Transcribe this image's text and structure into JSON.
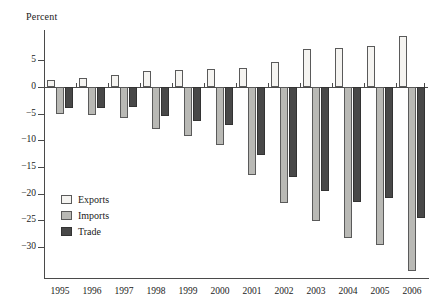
{
  "figure": {
    "clipped_header_text": "",
    "axis_unit_label": "Percent"
  },
  "legend": {
    "position": "inside-lower-left",
    "items": [
      {
        "label": "Exports",
        "color": "#f5f4f1",
        "key": "exports"
      },
      {
        "label": "Imports",
        "color": "#b9b9b5",
        "key": "imports"
      },
      {
        "label": "Trade",
        "color": "#484848",
        "key": "trade"
      }
    ]
  },
  "yaxis": {
    "ticks": [
      {
        "value": 5,
        "label": "5"
      },
      {
        "value": 0,
        "label": "0"
      },
      {
        "value": -5,
        "label": "−5"
      },
      {
        "value": -10,
        "label": "−10"
      },
      {
        "value": -15,
        "label": "−15"
      },
      {
        "value": -20,
        "label": "−20"
      },
      {
        "value": -25,
        "label": "−25"
      },
      {
        "value": -30,
        "label": "−30"
      }
    ]
  },
  "chart_data": {
    "type": "bar",
    "title": "",
    "xlabel": "",
    "ylabel": "Percent",
    "ylim": [
      -35.5,
      8.5
    ],
    "grid": false,
    "legend_position": "inside-lower-left",
    "categories": [
      "1995",
      "1996",
      "1997",
      "1998",
      "1999",
      "2000",
      "2001",
      "2002",
      "2003",
      "2004",
      "2005",
      "2006"
    ],
    "series": [
      {
        "name": "Exports",
        "color": "#f5f4f1",
        "values": [
          1.3,
          1.7,
          2.2,
          3.0,
          3.2,
          3.3,
          3.6,
          4.7,
          7.2,
          7.3,
          7.6,
          9.6
        ]
      },
      {
        "name": "Imports",
        "color": "#b9b9b5",
        "values": [
          -5.1,
          -5.3,
          -5.8,
          -7.9,
          -9.2,
          -10.8,
          -16.5,
          -21.8,
          -25.2,
          -28.3,
          -29.6,
          -34.6
        ]
      },
      {
        "name": "Trade",
        "color": "#484848",
        "values": [
          -4.0,
          -3.9,
          -3.8,
          -5.5,
          -6.3,
          -7.1,
          -12.8,
          -16.8,
          -19.6,
          -21.5,
          -20.8,
          -24.5
        ]
      }
    ]
  }
}
